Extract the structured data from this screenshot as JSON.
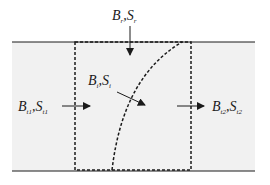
{
  "diagram": {
    "type": "control-volume flux schematic",
    "colors": {
      "background": "#ffffff",
      "band": "#f1f1f1",
      "line": "#1a1a1a"
    },
    "labels": {
      "top": {
        "main1": "B",
        "sub1": "r",
        "sep": ",",
        "main2": "S",
        "sub2": "r"
      },
      "interface": {
        "main1": "B",
        "sub1": "i",
        "sep": ",",
        "main2": "S",
        "sub2": "i"
      },
      "left": {
        "main1": "B",
        "sub1": "t1",
        "sep": ",",
        "main2": "S",
        "sub2": "t1"
      },
      "right": {
        "main1": "B",
        "sub1": "t2",
        "sep": ",",
        "main2": "S",
        "sub2": "t2"
      }
    },
    "elements": [
      "top boundary line",
      "bottom boundary line",
      "dashed control volume",
      "dashed curved interface",
      "arrow down from top",
      "arrow into interface",
      "arrow in from left",
      "arrow out to right"
    ]
  }
}
